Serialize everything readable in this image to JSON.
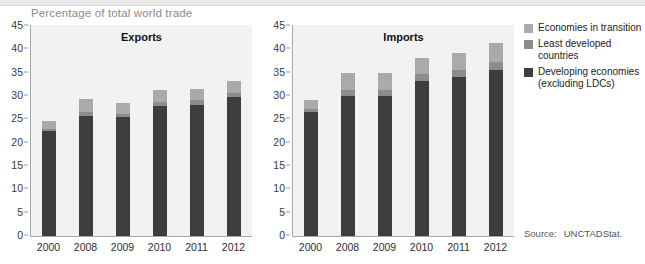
{
  "caption": "Percentage of total world trade",
  "source": {
    "label": "Source:",
    "value": "UNCTADStat."
  },
  "legend": [
    {
      "name": "Economies in transition",
      "color": "#aaaaaa"
    },
    {
      "name": "Least developed countries",
      "color": "#8c8c8c"
    },
    {
      "name": "Developing economies (excluding LDCs)",
      "line1": "Developing economies",
      "line2": "(excluding LDCs)",
      "color": "#3d3d3d"
    }
  ],
  "yticks": [
    "45",
    "40",
    "35",
    "30",
    "25",
    "20",
    "15",
    "10",
    "5",
    "0"
  ],
  "chart_data": [
    {
      "type": "bar",
      "title": "Exports",
      "stacked": true,
      "xlabel": "",
      "ylabel": "Percentage of total world trade",
      "ylim": [
        0,
        45
      ],
      "ytick_step": 5,
      "grid": false,
      "legend_position": "right",
      "categories": [
        "2000",
        "2008",
        "2009",
        "2010",
        "2011",
        "2012"
      ],
      "series": [
        {
          "name": "Developing economies (excluding LDCs)",
          "color": "#3d3d3d",
          "values": [
            22.4,
            25.8,
            25.4,
            27.9,
            28.1,
            29.7
          ]
        },
        {
          "name": "Least developed countries",
          "color": "#8c8c8c",
          "values": [
            0.6,
            0.8,
            0.7,
            0.9,
            1.0,
            1.0
          ]
        },
        {
          "name": "Economies in transition",
          "color": "#aaaaaa",
          "values": [
            1.7,
            2.7,
            2.5,
            2.4,
            2.5,
            2.6
          ]
        }
      ],
      "totals": [
        24.7,
        29.3,
        28.6,
        31.2,
        31.6,
        33.3
      ]
    },
    {
      "type": "bar",
      "title": "Imports",
      "stacked": true,
      "xlabel": "",
      "ylabel": "Percentage of total world trade",
      "ylim": [
        0,
        45
      ],
      "ytick_step": 5,
      "grid": false,
      "legend_position": "right",
      "categories": [
        "2000",
        "2008",
        "2009",
        "2010",
        "2011",
        "2012"
      ],
      "series": [
        {
          "name": "Developing economies (excluding LDCs)",
          "color": "#3d3d3d",
          "values": [
            26.5,
            30.0,
            30.1,
            33.3,
            34.1,
            35.6
          ]
        },
        {
          "name": "Least developed countries",
          "color": "#8c8c8c",
          "values": [
            0.8,
            1.2,
            1.2,
            1.4,
            1.5,
            1.7
          ]
        },
        {
          "name": "Economies in transition",
          "color": "#aaaaaa",
          "values": [
            1.9,
            3.8,
            3.6,
            3.4,
            3.7,
            4.1
          ]
        }
      ],
      "totals": [
        29.2,
        35.0,
        34.9,
        38.1,
        39.3,
        41.4
      ]
    }
  ]
}
